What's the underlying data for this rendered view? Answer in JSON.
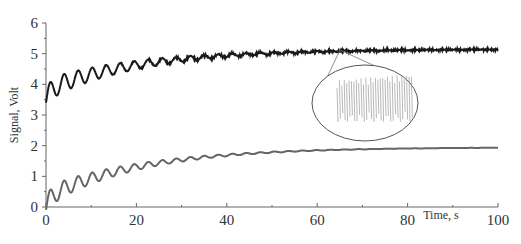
{
  "chart_data": {
    "type": "line",
    "title": "",
    "xlabel": "Time, s",
    "ylabel": "Signal, Volt",
    "xlim": [
      0,
      100
    ],
    "ylim": [
      0,
      6
    ],
    "x_ticks": [
      0,
      20,
      40,
      60,
      80,
      100
    ],
    "y_ticks": [
      0,
      1,
      2,
      3,
      4,
      5,
      6
    ],
    "grid": false,
    "legend": "none",
    "series": [
      {
        "name": "upper signal",
        "color": "#1a1a1a",
        "description": "damped oscillation rising from ~3.5 V, first peak ~4.3 V at t≈1 s, settling near ~5.15 V; noisy at plateau",
        "x": [
          0,
          1,
          3,
          5,
          7,
          10,
          15,
          20,
          30,
          40,
          50,
          60,
          70,
          80,
          90,
          100
        ],
        "values": [
          3.5,
          4.3,
          3.7,
          4.4,
          3.9,
          4.55,
          4.6,
          4.7,
          4.85,
          4.95,
          5.05,
          5.1,
          5.12,
          5.13,
          5.14,
          5.15
        ]
      },
      {
        "name": "lower signal",
        "color": "#555555",
        "description": "damped oscillation rising from 0 V, first peak ~0.75 V at t≈1.5 s, settling near ~1.95 V",
        "x": [
          0,
          1.5,
          3,
          5,
          7,
          10,
          15,
          20,
          30,
          40,
          50,
          60,
          70,
          80,
          90,
          100
        ],
        "values": [
          0,
          0.75,
          0.25,
          0.85,
          0.5,
          1.05,
          1.2,
          1.35,
          1.55,
          1.75,
          1.85,
          1.9,
          1.92,
          1.93,
          1.94,
          1.95
        ]
      }
    ],
    "annotations": [
      {
        "type": "inset-ellipse",
        "description": "magnified view of noisy upper signal near t≈65 s",
        "center_px": [
          365,
          103
        ],
        "connector_from_px": [
          340,
          50
        ]
      }
    ]
  },
  "axes": {
    "x_tick_labels": [
      "0",
      "20",
      "40",
      "60",
      "80",
      "100"
    ],
    "y_tick_labels": [
      "0",
      "1",
      "2",
      "3",
      "4",
      "5",
      "6"
    ],
    "xlabel": "Time, s",
    "ylabel": "Signal, Volt"
  }
}
